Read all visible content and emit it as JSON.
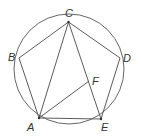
{
  "figure": {
    "circle": {
      "cx": 69,
      "cy": 69,
      "r": 55
    },
    "points": {
      "A": {
        "x": 39,
        "y": 118,
        "label": "A",
        "lx": 27,
        "ly": 131
      },
      "B": {
        "x": 19,
        "y": 58,
        "label": "B",
        "lx": 8,
        "ly": 61
      },
      "C": {
        "x": 68.5,
        "y": 22,
        "label": "C",
        "lx": 65,
        "ly": 17
      },
      "D": {
        "x": 120,
        "y": 58,
        "label": "D",
        "lx": 123,
        "ly": 62
      },
      "E": {
        "x": 101,
        "y": 119,
        "label": "E",
        "lx": 101,
        "ly": 131
      },
      "F": {
        "x": 89,
        "y": 81,
        "label": "F",
        "lx": 92,
        "ly": 85
      }
    },
    "segments": [
      [
        "A",
        "B"
      ],
      [
        "B",
        "C"
      ],
      [
        "C",
        "D"
      ],
      [
        "D",
        "E"
      ],
      [
        "E",
        "A"
      ],
      [
        "A",
        "C"
      ],
      [
        "C",
        "E"
      ],
      [
        "A",
        "F"
      ]
    ],
    "dots": [
      "C",
      "A",
      "E"
    ],
    "colors": {
      "stroke": "#4a4a4a",
      "label": "#333333",
      "background": "#ffffff"
    }
  }
}
